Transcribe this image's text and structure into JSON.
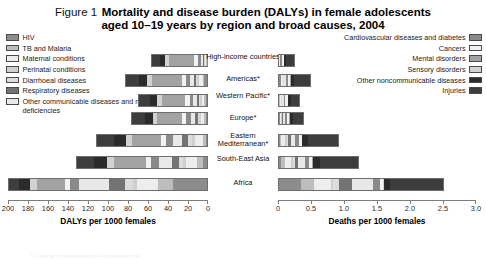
{
  "header": {
    "figure_number": "Figure 1",
    "title_line1": "Mortality and disease burden (DALYs) in female adolescents",
    "title_line2": "aged 10–19 years by region and broad causes, 2004"
  },
  "legend_left": {
    "items": [
      {
        "label": "HIV",
        "color": "#8c8c8c"
      },
      {
        "label": "TB and Malaria",
        "color": "#bdbdbd"
      },
      {
        "label": "Maternal conditions",
        "color": "#ededed"
      },
      {
        "label": "Perinatal conditions",
        "color": "#cfcfcf"
      },
      {
        "label": "Diarrhoeal diseases",
        "color": "#dcdcdc"
      },
      {
        "label": "Respiratory diseases",
        "color": "#737373"
      },
      {
        "label": "Other communicable diseases and nutritional deficiencies",
        "color": "#e8e8e8"
      }
    ]
  },
  "legend_right": {
    "items": [
      {
        "label": "Cardiovascular diseases and diabetes",
        "color": "#8a8a8a"
      },
      {
        "label": "Cancers",
        "color": "#f2f2f2"
      },
      {
        "label": "Mental disorders",
        "color": "#a3a3a3"
      },
      {
        "label": "Sensory disorders",
        "color": "#d2d2d2"
      },
      {
        "label": "Other noncommunicable diseases",
        "color": "#2b2b2b"
      },
      {
        "label": "Injuries",
        "color": "#3d3d3d"
      }
    ]
  },
  "chart_data": {
    "type": "bar",
    "subtype": "back-to-back stacked horizontal bar",
    "title": "Mortality and disease burden (DALYs) in female adolescents aged 10–19 years by region and broad causes, 2004",
    "grid": false,
    "legend_position": "top-left and top-right",
    "categories": [
      "High-income countries",
      "Americas*",
      "Western Pacific*",
      "Europe*",
      "Eastern Mediterranean*",
      "South-East Asia",
      "Africa"
    ],
    "cause_names": [
      "HIV",
      "TB and Malaria",
      "Maternal conditions",
      "Perinatal conditions",
      "Diarrhoeal diseases",
      "Respiratory diseases",
      "Other communicable diseases and nutritional deficiencies",
      "Cardiovascular diseases and diabetes",
      "Cancers",
      "Mental disorders",
      "Sensory disorders",
      "Other noncommunicable diseases",
      "Injuries"
    ],
    "cause_colors": [
      "#8c8c8c",
      "#bdbdbd",
      "#ededed",
      "#cfcfcf",
      "#dcdcdc",
      "#737373",
      "#e8e8e8",
      "#8a8a8a",
      "#f2f2f2",
      "#a3a3a3",
      "#d2d2d2",
      "#2b2b2b",
      "#3d3d3d"
    ],
    "panels": [
      {
        "id": "dalys",
        "xlabel": "DALYs per 1000 females",
        "unit": "DALYs per 1000 females",
        "direction": "left",
        "xlim": [
          0,
          200
        ],
        "reversed": true,
        "ticks": [
          200,
          180,
          160,
          140,
          120,
          100,
          80,
          60,
          40,
          20,
          0
        ],
        "series": [
          {
            "name": "High-income countries",
            "total": 57,
            "values": [
              0.5,
              0.4,
              1.0,
              1.0,
              0.3,
              1.0,
              2.0,
              3.0,
              4.5,
              26.0,
              4.0,
              5.5,
              8.0
            ]
          },
          {
            "name": "Americas*",
            "total": 83,
            "values": [
              3.5,
              1.0,
              4.0,
              2.0,
              1.0,
              2.0,
              4.0,
              4.5,
              4.5,
              31.0,
              5.0,
              8.0,
              13.5
            ]
          },
          {
            "name": "Western Pacific*",
            "total": 70,
            "values": [
              1.0,
              2.0,
              2.5,
              1.5,
              1.0,
              2.0,
              4.0,
              4.0,
              4.5,
              24.0,
              5.0,
              7.5,
              11.0
            ]
          },
          {
            "name": "Europe*",
            "total": 77,
            "values": [
              1.5,
              2.0,
              3.0,
              2.0,
              1.0,
              2.5,
              4.5,
              5.5,
              4.5,
              25.0,
              5.0,
              8.0,
              13.5
            ]
          },
          {
            "name": "Eastern Mediterranean*",
            "total": 112,
            "values": [
              1.0,
              3.0,
              8.0,
              3.5,
              3.5,
              6.0,
              10.0,
              7.0,
              4.5,
              30.0,
              6.5,
              12.0,
              17.0
            ]
          },
          {
            "name": "South-East Asia",
            "total": 132,
            "values": [
              4.0,
              6.5,
              10.5,
              3.5,
              4.0,
              7.0,
              13.0,
              8.5,
              5.0,
              33.0,
              7.0,
              13.0,
              17.0
            ]
          },
          {
            "name": "Africa",
            "total": 200,
            "values": [
              34.0,
              16.0,
              21.0,
              4.0,
              8.0,
              16.0,
              30.0,
              9.0,
              5.5,
              28.0,
              7.5,
              10.5,
              10.5
            ]
          }
        ]
      },
      {
        "id": "deaths",
        "xlabel": "Deaths per 1000 females",
        "unit": "Deaths per 1000 females",
        "direction": "right",
        "xlim": [
          0,
          3.0
        ],
        "reversed": false,
        "ticks": [
          0,
          0.5,
          1.0,
          1.5,
          2.0,
          2.5,
          3.0
        ],
        "series": [
          {
            "name": "High-income countries",
            "total": 0.26,
            "values": [
              0.003,
              0.002,
              0.004,
              0.004,
              0.001,
              0.004,
              0.007,
              0.022,
              0.042,
              0.004,
              0.002,
              0.031,
              0.134
            ]
          },
          {
            "name": "Americas*",
            "total": 0.5,
            "values": [
              0.03,
              0.008,
              0.022,
              0.01,
              0.005,
              0.012,
              0.022,
              0.036,
              0.04,
              0.006,
              0.003,
              0.056,
              0.25
            ]
          },
          {
            "name": "Western Pacific*",
            "total": 0.33,
            "values": [
              0.007,
              0.014,
              0.014,
              0.007,
              0.005,
              0.011,
              0.02,
              0.03,
              0.037,
              0.004,
              0.002,
              0.044,
              0.135
            ]
          },
          {
            "name": "Europe*",
            "total": 0.4,
            "values": [
              0.009,
              0.013,
              0.018,
              0.009,
              0.005,
              0.015,
              0.024,
              0.042,
              0.038,
              0.005,
              0.002,
              0.053,
              0.167
            ]
          },
          {
            "name": "Eastern Mediterranean*",
            "total": 0.92,
            "values": [
              0.008,
              0.025,
              0.065,
              0.022,
              0.022,
              0.042,
              0.07,
              0.06,
              0.04,
              0.006,
              0.003,
              0.094,
              0.463
            ]
          },
          {
            "name": "South-East Asia",
            "total": 1.23,
            "values": [
              0.035,
              0.06,
              0.095,
              0.025,
              0.028,
              0.055,
              0.1,
              0.075,
              0.045,
              0.007,
              0.003,
              0.11,
              0.592
            ]
          },
          {
            "name": "Africa",
            "total": 2.52,
            "values": [
              0.33,
              0.2,
              0.27,
              0.035,
              0.09,
              0.19,
              0.33,
              0.1,
              0.05,
              0.008,
              0.004,
              0.103,
              0.81
            ]
          }
        ]
      }
    ]
  },
  "axes": {
    "left": {
      "title": "DALYs per 1000 females",
      "ticks": [
        "200",
        "180",
        "160",
        "140",
        "120",
        "100",
        "80",
        "60",
        "40",
        "20",
        "0"
      ]
    },
    "right": {
      "title": "Deaths per 1000 females",
      "ticks": [
        "0",
        "0.5",
        "1.0",
        "1.5",
        "2.0",
        "2.5",
        "3.0"
      ]
    }
  },
  "footnote": {
    "text": "* Low- and middle-income countries only"
  }
}
